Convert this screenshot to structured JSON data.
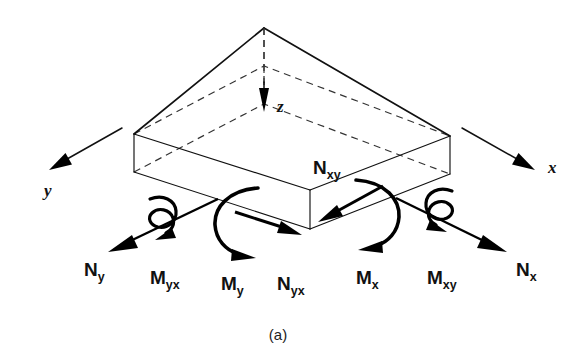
{
  "figure": {
    "caption": "(a)",
    "background_color": "#ffffff",
    "line_color": "#111111"
  },
  "axes": [
    {
      "id": "x",
      "label": "x",
      "direction": "down-right",
      "style": "solid-arrow"
    },
    {
      "id": "y",
      "label": "y",
      "direction": "down-left",
      "style": "solid-arrow"
    },
    {
      "id": "z",
      "label": "z",
      "direction": "down",
      "style": "dashed-line-solid-arrow"
    }
  ],
  "force_labels": [
    {
      "id": "Nx",
      "base": "N",
      "sub": "x",
      "label": "Nₓ",
      "kind": "normal-force"
    },
    {
      "id": "Ny",
      "base": "N",
      "sub": "y",
      "label": "Nᵧ",
      "kind": "normal-force"
    },
    {
      "id": "Nxy",
      "base": "N",
      "sub": "xy",
      "label": "Nₓᵧ",
      "kind": "shear-force"
    },
    {
      "id": "Nyx",
      "base": "N",
      "sub": "yx",
      "label": "Nᵧₓ",
      "kind": "shear-force"
    }
  ],
  "moment_labels": [
    {
      "id": "Mx",
      "base": "M",
      "sub": "x",
      "label": "Mₓ",
      "kind": "bending-moment"
    },
    {
      "id": "My",
      "base": "M",
      "sub": "y",
      "label": "Mᵧ",
      "kind": "bending-moment"
    },
    {
      "id": "Mxy",
      "base": "M",
      "sub": "xy",
      "label": "Mₓᵧ",
      "kind": "twisting-moment"
    },
    {
      "id": "Myx",
      "base": "M",
      "sub": "yx",
      "label": "Mᵧₓ",
      "kind": "twisting-moment"
    }
  ],
  "subscripts": {
    "x": "x",
    "y": "y",
    "xy": "xy",
    "yx": "yx"
  },
  "bases": {
    "N": "N",
    "M": "M"
  }
}
